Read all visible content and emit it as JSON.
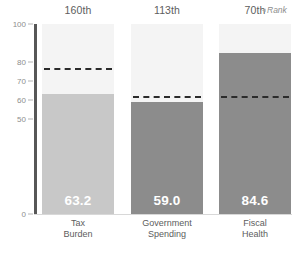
{
  "chart_data": {
    "type": "bar",
    "title": "",
    "subtitle": "",
    "xlabel": "",
    "ylabel": "",
    "ylim": [
      0,
      100
    ],
    "yticks": [
      0,
      50,
      60,
      70,
      80,
      100
    ],
    "ytick_labels": [
      "0",
      "50",
      "60",
      "70",
      "80",
      "100"
    ],
    "grid": false,
    "legend": "none",
    "categories": [
      "Tax\nBurden",
      "Government\nSpending",
      "Fiscal\nHealth"
    ],
    "values": [
      63.2,
      59.0,
      84.6
    ],
    "value_labels": [
      "63.2",
      "59.0",
      "84.6"
    ],
    "ranks": [
      "160th",
      "113th",
      "70th"
    ],
    "reference_lines": [
      77.0,
      62.0,
      62.0
    ],
    "bar_colors": [
      "#c8c8c8",
      "#8c8c8c",
      "#8c8c8c"
    ],
    "column_background_color": "#f4f4f4",
    "reference_line_color": "#2b2b2b",
    "axis_spine_color": "#575757"
  },
  "header": {
    "rank_legend": "Rank",
    "rank_legend_caret": "◂"
  }
}
